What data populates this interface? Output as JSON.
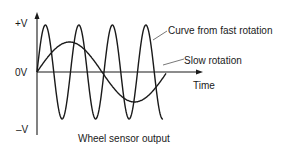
{
  "diagram": {
    "axis_labels": {
      "y_top": "+V",
      "y_zero": "0V",
      "y_bottom": "–V",
      "x": "Time"
    },
    "annotations": {
      "fast": "Curve from fast rotation",
      "slow": "Slow rotation"
    },
    "caption": "Wheel sensor output",
    "colors": {
      "ink": "#1a1a1a",
      "leader": "#555555"
    }
  },
  "chart_data": {
    "type": "line",
    "title": "Wheel sensor output",
    "xlabel": "Time",
    "ylabel": "Voltage",
    "y_ticks": [
      "+V",
      "0V",
      "–V"
    ],
    "series": [
      {
        "name": "Curve from fast rotation",
        "shape": "sine",
        "amplitude": 1.0,
        "cycles": 3.75
      },
      {
        "name": "Slow rotation",
        "shape": "sine",
        "amplitude": 0.6,
        "cycles": 1.1
      }
    ],
    "grid": false,
    "legend": "inline annotations"
  }
}
